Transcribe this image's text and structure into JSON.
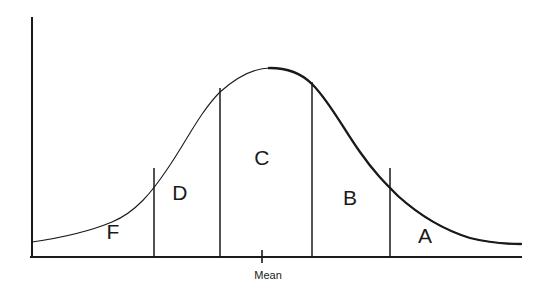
{
  "figure": {
    "type": "normal-distribution-grade-curve",
    "background_color": "#ffffff",
    "stroke_color": "#1a1a1a",
    "width": 543,
    "height": 296
  },
  "axes": {
    "y_axis": {
      "name": "y-axis",
      "x": 32,
      "y_top": 18,
      "y_bottom": 257
    },
    "x_axis": {
      "name": "x-axis",
      "y": 257,
      "x_left": 32,
      "x_right": 521
    },
    "mean_tick": {
      "label": "Mean",
      "x": 262,
      "y_top": 250,
      "y_bottom": 263,
      "label_x": 268,
      "label_y": 275
    }
  },
  "regions": [
    {
      "id": "region-f",
      "label": "F",
      "label_x": 113,
      "label_y": 231,
      "left_x": 32,
      "right_x": 154
    },
    {
      "id": "region-d",
      "label": "D",
      "label_x": 180,
      "label_y": 192,
      "left_x": 154,
      "right_x": 220
    },
    {
      "id": "region-c",
      "label": "C",
      "label_x": 262,
      "label_y": 157,
      "left_x": 220,
      "right_x": 312
    },
    {
      "id": "region-b",
      "label": "B",
      "label_x": 350,
      "label_y": 197,
      "left_x": 312,
      "right_x": 390
    },
    {
      "id": "region-a",
      "label": "A",
      "label_x": 425,
      "label_y": 235,
      "left_x": 390,
      "right_x": 521
    }
  ],
  "dividers": [
    {
      "id": "divider-f-d",
      "x": 154,
      "y_top": 168,
      "y_bottom": 257
    },
    {
      "id": "divider-d-c",
      "x": 220,
      "y_top": 88,
      "y_bottom": 257
    },
    {
      "id": "divider-c-b",
      "x": 312,
      "y_top": 82,
      "y_bottom": 257
    },
    {
      "id": "divider-b-a",
      "x": 390,
      "y_top": 168,
      "y_bottom": 257
    }
  ],
  "chart_data": {
    "type": "line",
    "title": "",
    "xlabel": "",
    "ylabel": "",
    "legend": [],
    "grid": false,
    "curve": {
      "name": "normal-distribution-curve",
      "peak_x": 270,
      "peak_y": 68,
      "left_end": {
        "x": 32,
        "y": 242
      },
      "right_end": {
        "x": 521,
        "y": 244
      },
      "path": "M 32,242 C 60,238 88,232 112,222 C 136,212 152,192 168,168 C 186,142 200,112 220,92 C 238,76 254,68 270,68 C 288,68 302,74 312,84 C 330,102 344,130 360,152 C 374,172 384,182 398,196 C 418,214 444,230 470,238 C 490,243 508,244 521,244",
      "thin_stroke_width": 1.1,
      "thick_stroke_width": 2.3
    },
    "x": [
      32,
      112,
      154,
      220,
      270,
      312,
      390,
      470,
      521
    ],
    "y": [
      242,
      222,
      168,
      92,
      68,
      84,
      196,
      238,
      244
    ],
    "annotations": [
      "F",
      "D",
      "C",
      "B",
      "A",
      "Mean"
    ]
  }
}
